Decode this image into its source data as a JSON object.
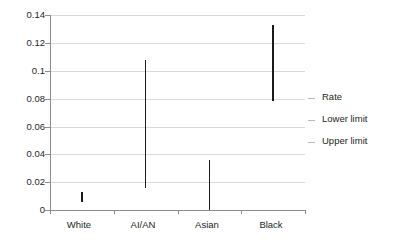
{
  "chart_data": {
    "type": "bar",
    "title": "",
    "subtitle": "",
    "xlabel": "",
    "ylabel": "",
    "categories": [
      "White",
      "AI/AN",
      "Asian",
      "Black"
    ],
    "ylim": [
      0,
      0.14
    ],
    "y_ticks": [
      "0",
      "0.02",
      "0.04",
      "0.06",
      "0.08",
      "0.1",
      "0.12",
      "0.14"
    ],
    "y_tick_values": [
      0,
      0.02,
      0.04,
      0.06,
      0.08,
      0.1,
      0.12,
      0.14
    ],
    "grid": true,
    "legend_position": "right",
    "legend": [
      "Rate",
      "Lower limit",
      "Upper limit"
    ],
    "series": [
      {
        "name": "Rate",
        "values": [
          0.01,
          0.062,
          0.018,
          0.105
        ]
      },
      {
        "name": "Lower limit",
        "values": [
          0.006,
          0.016,
          0.0,
          0.078
        ]
      },
      {
        "name": "Upper limit",
        "values": [
          0.013,
          0.108,
          0.036,
          0.133
        ]
      }
    ],
    "points": [
      {
        "category": "White",
        "lower": 0.006,
        "upper": 0.013
      },
      {
        "category": "AI/AN",
        "lower": 0.016,
        "upper": 0.108
      },
      {
        "category": "Asian",
        "lower": 0.0,
        "upper": 0.036
      },
      {
        "category": "Black",
        "lower": 0.078,
        "upper": 0.133
      }
    ],
    "colors": {
      "bar": "#1a1a1a",
      "gridline": "#d9d9d9",
      "axis": "#8c8c8c",
      "text": "#231f20",
      "background": "#ffffff"
    }
  }
}
